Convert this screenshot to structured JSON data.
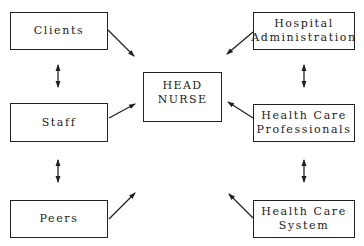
{
  "diagram": {
    "center": {
      "line1": "HEAD",
      "line2": "NURSE",
      "symbol": "⟷"
    },
    "left": [
      {
        "label": "Clients"
      },
      {
        "label": "Staff"
      },
      {
        "label": "Peers"
      }
    ],
    "right": [
      {
        "line1": "Hospital",
        "line2": "Administration"
      },
      {
        "line1": "Health Care",
        "line2": "Professionals"
      },
      {
        "line1": "Health Care",
        "line2": "System"
      }
    ]
  }
}
